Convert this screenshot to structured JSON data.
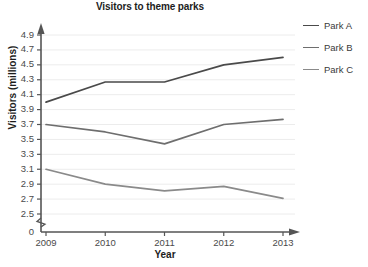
{
  "chart_data": {
    "type": "line",
    "title": "Visitors to theme parks",
    "xlabel": "Year",
    "ylabel": "Visitors (millions)",
    "categories": [
      "2009",
      "2010",
      "2011",
      "2012",
      "2013"
    ],
    "x_tick_labels": [
      "2009",
      "2010",
      "2011",
      "2012",
      "2013"
    ],
    "y_tick_labels": [
      "4.9",
      "4.7",
      "4.5",
      "4.3",
      "4.1",
      "3.9",
      "3.7",
      "3.5",
      "3.3",
      "3.1",
      "2.9",
      "2.7",
      "2.5",
      "0"
    ],
    "y_tick_values": [
      4.9,
      4.7,
      4.5,
      4.3,
      4.1,
      3.9,
      3.7,
      3.5,
      3.3,
      3.1,
      2.9,
      2.7,
      2.5,
      0
    ],
    "ylim": [
      2.4,
      5.0
    ],
    "y_axis_break": true,
    "y_axis_break_label": "0",
    "grid": true,
    "grid_axis": "y",
    "legend_position": "right",
    "series": [
      {
        "name": "Park A",
        "color": "#4a4a4a",
        "values": [
          4.0,
          4.27,
          4.27,
          4.5,
          4.6
        ]
      },
      {
        "name": "Park B",
        "color": "#6e6e6e",
        "values": [
          3.7,
          3.6,
          3.44,
          3.7,
          3.77
        ]
      },
      {
        "name": "Park C",
        "color": "#8a8a8a",
        "values": [
          3.1,
          2.9,
          2.81,
          2.87,
          2.71
        ]
      }
    ]
  },
  "legend": {
    "items": [
      {
        "label": "Park A"
      },
      {
        "label": "Park B"
      },
      {
        "label": "Park C"
      }
    ]
  },
  "colors": {
    "axis": "#555555",
    "grid": "#ececec",
    "text": "#1d1d1d",
    "tick_text": "#4a4a4a",
    "background": "#ffffff"
  }
}
